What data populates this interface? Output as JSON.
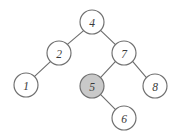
{
  "figure": {
    "type": "binary-search-tree-diagram",
    "background_color": "#ffffff",
    "stroke_color": "#6f6f6f",
    "label_color": "#3a3a3a",
    "node_radius": 12,
    "highlight_fill": "#c9c9c9",
    "default_fill": "#ffffff"
  },
  "nodes": [
    {
      "id": "n4",
      "label": "4",
      "cx": 92,
      "cy": 22,
      "r": 12,
      "highlighted": false,
      "fill": "#ffffff",
      "level": 0
    },
    {
      "id": "n2",
      "label": "2",
      "cx": 59,
      "cy": 53,
      "r": 12,
      "highlighted": false,
      "fill": "#ffffff",
      "level": 1
    },
    {
      "id": "n7",
      "label": "7",
      "cx": 124,
      "cy": 53,
      "r": 12,
      "highlighted": false,
      "fill": "#ffffff",
      "level": 1
    },
    {
      "id": "n1",
      "label": "1",
      "cx": 26,
      "cy": 85,
      "r": 12,
      "highlighted": false,
      "fill": "#ffffff",
      "level": 2
    },
    {
      "id": "n5",
      "label": "5",
      "cx": 92,
      "cy": 86,
      "r": 12,
      "highlighted": true,
      "fill": "#c9c9c9",
      "level": 2
    },
    {
      "id": "n8",
      "label": "8",
      "cx": 155,
      "cy": 86,
      "r": 12,
      "highlighted": false,
      "fill": "#ffffff",
      "level": 2
    },
    {
      "id": "n6",
      "label": "6",
      "cx": 124,
      "cy": 118,
      "r": 12,
      "highlighted": false,
      "fill": "#ffffff",
      "level": 3
    }
  ],
  "edges": [
    {
      "id": "e4-2",
      "from": "n4",
      "to": "n2",
      "x1": 83.6,
      "y1": 30.6,
      "x2": 67.4,
      "y2": 44.4
    },
    {
      "id": "e4-7",
      "from": "n4",
      "to": "n7",
      "x1": 100.8,
      "y1": 30.7,
      "x2": 115.2,
      "y2": 44.3
    },
    {
      "id": "e2-1",
      "from": "n2",
      "to": "n1",
      "x1": 50.4,
      "y1": 61.7,
      "x2": 34.6,
      "y2": 76.3
    },
    {
      "id": "e7-5",
      "from": "n7",
      "to": "n5",
      "x1": 115.3,
      "y1": 61.6,
      "x2": 100.7,
      "y2": 77.4
    },
    {
      "id": "e7-8",
      "from": "n7",
      "to": "n8",
      "x1": 132.8,
      "y1": 61.7,
      "x2": 146.2,
      "y2": 77.3
    },
    {
      "id": "e5-6",
      "from": "n5",
      "to": "n6",
      "x1": 100.7,
      "y1": 94.6,
      "x2": 115.3,
      "y2": 109.4
    }
  ]
}
